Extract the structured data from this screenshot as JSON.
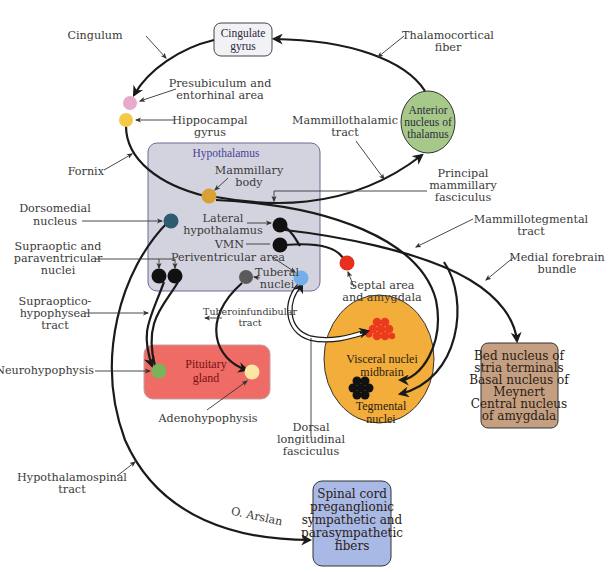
{
  "diagram": {
    "type": "neuroanatomy-pathway",
    "colors": {
      "hypothalamus_box": "#d3d3df",
      "hypothalamus_title": "#4b3f9a",
      "cingulate_box": "#f2f2f6",
      "anterior_thalamus": "#a6c98a",
      "pituitary_box": "#ee6b66",
      "midbrain_oval": "#f2ad3a",
      "bed_nucleus_box": "#c49f82",
      "spinal_box": "#a9b9e6",
      "presubiculum_dot": "#e9a9cc",
      "hippocampal_dot": "#f4c84a",
      "mammillary_dot": "#d9a035",
      "dorsomedial_dot": "#2f5b6e",
      "tuberal_dot": "#5a5a5a",
      "periventricular_dot": "#74aee8",
      "septal_dot": "#e8301e",
      "neurohypophysis_dot": "#7ab35a",
      "adenohypophysis_dot": "#fbe7a3",
      "visceral_cluster": "#ec3a1e",
      "tegmental_cluster": "#111111"
    }
  },
  "boxes": {
    "cingulate": [
      "Cingulate",
      "gyrus"
    ],
    "anterior_thalamus": [
      "Anterior",
      "nucleus of",
      "thalamus"
    ],
    "hypothalamus_title": "Hypothalamus",
    "pituitary": [
      "Pituitary",
      "gland"
    ],
    "midbrain": {
      "visceral": [
        "Visceral nuclei",
        "midbrain"
      ],
      "tegmental": [
        "Tegmental",
        "nuclei"
      ]
    },
    "bed_nucleus": [
      "Bed nucleus of",
      "stria terminals",
      "Basal nucleus of",
      "Meynert",
      "Central nucleus",
      "of amygdala"
    ],
    "spinal": [
      "Spinal cord",
      "preganglionic",
      "sympathetic and",
      "parasympathetic",
      "fibers"
    ]
  },
  "labels": {
    "cingulum": "Cingulum",
    "thalamocortical": [
      "Thalamocortical",
      "fiber"
    ],
    "presubiculum": [
      "Presubiculum and",
      "entorhinal area"
    ],
    "hippocampal": [
      "Hippocampal",
      "gyrus"
    ],
    "fornix": "Fornix",
    "mammillothalamic": [
      "Mammillothalamic",
      "tract"
    ],
    "mammillary_body": [
      "Mammillary",
      "body"
    ],
    "principal_mammillary": [
      "Principal",
      "mammillary",
      "fasciculus"
    ],
    "dorsomedial": [
      "Dorsomedial",
      "nucleus"
    ],
    "lateral_hypothalamus": [
      "Lateral",
      "hypothalamus"
    ],
    "vmn": "VMN",
    "mammillotegmental": [
      "Mammillotegmental",
      "tract"
    ],
    "supraoptic": [
      "Supraoptic and",
      "paraventricular",
      "nuclei"
    ],
    "periventricular": "Periventricular area",
    "medial_forebrain": [
      "Medial forebrain",
      "bundle"
    ],
    "tuberal": [
      "Tuberal",
      "nuclei"
    ],
    "septal": [
      "Septal area",
      "and amygdala"
    ],
    "supraoptico_hypophyseal": [
      "Supraoptico-",
      "hypophyseal",
      "tract"
    ],
    "tuberoinfundibular": [
      "Tuberoinfundibular",
      "tract"
    ],
    "neurohypophysis": "Neurohypophysis",
    "adenohypophysis": "Adenohypophysis",
    "dorsal_longitudinal": [
      "Dorsal",
      "longitudinal",
      "fasciculus"
    ],
    "hypothalamospinal": [
      "Hypothalamospinal",
      "tract"
    ],
    "credit": "O. Arslan"
  }
}
